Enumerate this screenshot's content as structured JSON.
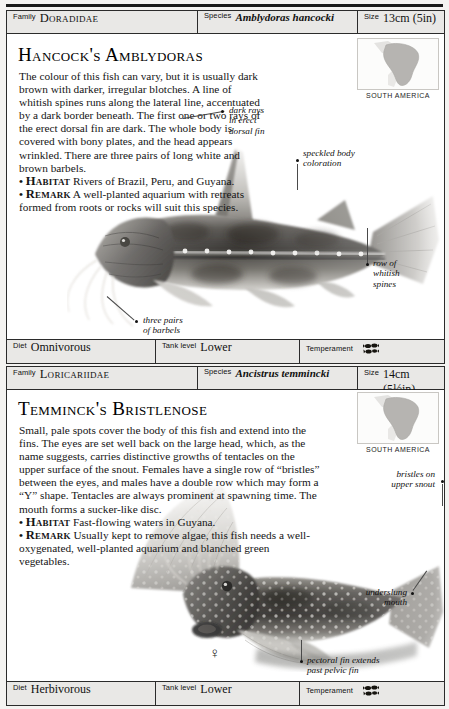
{
  "page": {
    "background": "#f4f3f1",
    "card_background": "#ffffff",
    "strip_background": "#e9e8e6",
    "rule_color": "#1a1a1a"
  },
  "entries": [
    {
      "header": {
        "family_label": "Family",
        "family_value": "Doradidae",
        "species_label": "Species",
        "species_value": "Amblydoras hancocki",
        "size_label": "Size",
        "size_value": "13cm (5in)"
      },
      "title": "Hancock's Amblydoras",
      "description": "The colour of this fish can vary, but it is usually dark brown with darker, irregular blotches. A line of whitish spines runs along the lateral line, accentuated by a dark border beneath. The first one or two rays of the erect dorsal fin are dark. The whole body is covered with bony plates, and the head appears wrinkled. There are three pairs of long white and brown barbels.",
      "habitat_keyword": "Habitat",
      "habitat_text": "Rivers of Brazil, Peru, and Guyana.",
      "remark_keyword": "Remark",
      "remark_text": "A well-planted aquarium with retreats formed from roots or rocks will suit this species.",
      "map_caption": "SOUTH AMERICA",
      "callouts": [
        {
          "text": "dark rays\nin erect\ndorsal fin",
          "name": "callout-dark-rays"
        },
        {
          "text": "speckled body\ncoloration",
          "name": "callout-speckled-body"
        },
        {
          "text": "row of\nwhitish\nspines",
          "name": "callout-whitish-spines"
        },
        {
          "text": "three pairs\nof barbels",
          "name": "callout-three-pairs-barbels"
        }
      ],
      "footer": {
        "diet_label": "Diet",
        "diet_value": "Omnivorous",
        "tank_label": "Tank level",
        "tank_value": "Lower",
        "temperament_label": "Temperament",
        "temperament_icon": "peaceful-shoal-icon"
      }
    },
    {
      "header": {
        "family_label": "Family",
        "family_value": "Loricariidae",
        "species_label": "Species",
        "species_value": "Ancistrus temmincki",
        "size_label": "Size",
        "size_value": "14cm (5½in)"
      },
      "title": "Temminck's Bristlenose",
      "description": "Small, pale spots cover the body of this fish and extend into the fins. The eyes are set well back on the large head, which, as the name suggests, carries distinctive growths of tentacles on the upper surface of the snout. Females have a single row of “bristles” between the eyes, and males have a double row which may form a “Y” shape. Tentacles are always prominent at spawning time. The mouth forms a sucker-like disc.",
      "habitat_keyword": "Habitat",
      "habitat_text": "Fast-flowing waters in Guyana.",
      "remark_keyword": "Remark",
      "remark_text": "Usually kept to remove algae, this fish needs a well-oxygenated, well-planted aquarium and blanched green vegetables.",
      "map_caption": "SOUTH AMERICA",
      "gender_symbol": "♀",
      "callouts": [
        {
          "text": "bristles on\nupper snout",
          "name": "callout-bristles-upper-snout"
        },
        {
          "text": "underslung\nmouth",
          "name": "callout-underslung-mouth"
        },
        {
          "text": "pectoral fin extends\npast pelvic fin",
          "name": "callout-pectoral-fin"
        }
      ],
      "footer": {
        "diet_label": "Diet",
        "diet_value": "Herbivorous",
        "tank_label": "Tank level",
        "tank_value": "Lower",
        "temperament_label": "Temperament",
        "temperament_icon": "peaceful-shoal-icon"
      }
    }
  ]
}
